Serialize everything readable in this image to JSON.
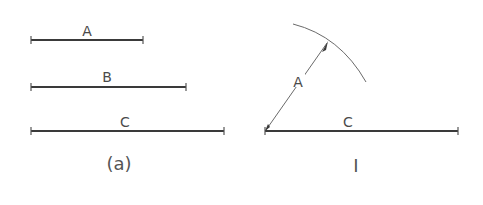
{
  "figure_a": {
    "caption": "(a)",
    "segments": [
      {
        "label": "A",
        "x1": 31,
        "x2": 143,
        "y": 40
      },
      {
        "label": "B",
        "x1": 31,
        "x2": 186,
        "y": 87
      },
      {
        "label": "C",
        "x1": 31,
        "x2": 224,
        "y": 131
      }
    ]
  },
  "figure_i": {
    "caption": "I",
    "base_segment": {
      "label": "C",
      "x1": 265,
      "x2": 458,
      "y": 131
    },
    "radius_segment": {
      "label": "A"
    },
    "arc_label": "arc of radius A"
  },
  "colors": {
    "line": "#3a3a3a",
    "text": "#4a4a4a",
    "background": "#ffffff"
  }
}
